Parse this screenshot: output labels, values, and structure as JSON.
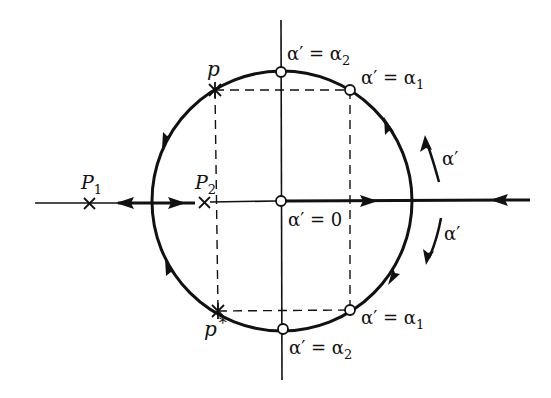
{
  "diagram": {
    "colors": {
      "stroke": "#111111",
      "background": "#ffffff"
    },
    "labels": {
      "p": "p",
      "p_star": "p",
      "p_star_sup": "*",
      "P1": "P",
      "P1_sub": "1",
      "P2": "P",
      "P2_sub": "2",
      "alpha_zero": "α′ = 0",
      "alpha2_top_lhs": "α′ = α",
      "alpha2_top_sub": "2",
      "alpha1_top_lhs": "α′ = α",
      "alpha1_top_sub": "1",
      "alpha2_bottom_lhs": "α′ = α",
      "alpha2_bottom_sub": "2",
      "alpha1_bottom_lhs": "α′ = α",
      "alpha1_bottom_sub": "1",
      "alpha_up_arrow": "α′",
      "alpha_down_arrow": "α′"
    },
    "points": [
      {
        "name": "p",
        "type": "cross",
        "x": 215,
        "y": 90
      },
      {
        "name": "p*",
        "type": "cross",
        "x": 218,
        "y": 311
      },
      {
        "name": "P1",
        "type": "cross",
        "x": 89,
        "y": 204
      },
      {
        "name": "P2",
        "type": "cross",
        "x": 204,
        "y": 203
      },
      {
        "name": "alpha'=0",
        "type": "circle",
        "x": 281,
        "y": 201
      },
      {
        "name": "alpha'=alpha2 (top)",
        "type": "circle",
        "x": 281,
        "y": 72
      },
      {
        "name": "alpha'=alpha1 (top)",
        "type": "circle",
        "x": 350,
        "y": 90
      },
      {
        "name": "alpha'=alpha2 (bottom)",
        "type": "circle",
        "x": 283,
        "y": 329
      },
      {
        "name": "alpha'=alpha1 (bottom)",
        "type": "circle",
        "x": 350,
        "y": 310
      }
    ]
  }
}
